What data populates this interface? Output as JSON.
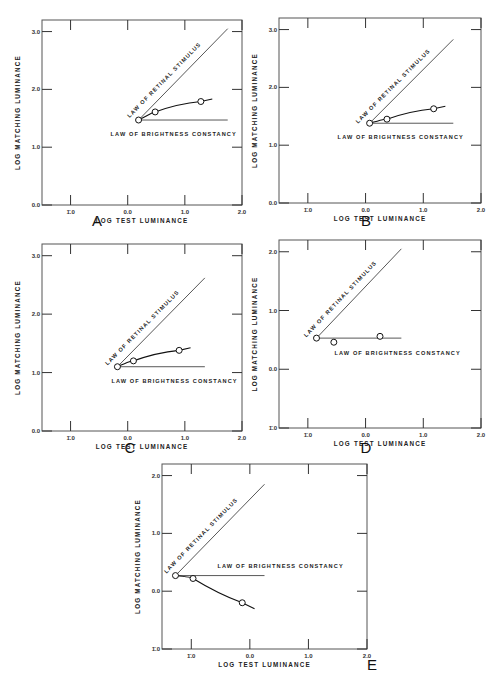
{
  "figure": {
    "panels_order": [
      "A",
      "B",
      "C",
      "D",
      "E"
    ]
  },
  "chart_data": [
    {
      "panel": "A",
      "type": "line",
      "xlabel": "LOG TEST LUMINANCE",
      "ylabel": "LOG MATCHING LUMINANCE",
      "x_ticks": [
        "1̄.0",
        "0.0",
        "1.0",
        "2.0"
      ],
      "x_tick_values": [
        -1.0,
        0.0,
        1.0,
        2.0
      ],
      "y_ticks": [
        "0.0",
        "1.0",
        "2.0",
        "3.0"
      ],
      "y_tick_values": [
        0.0,
        1.0,
        2.0,
        3.0
      ],
      "xlim": [
        -1.5,
        2.0
      ],
      "ylim": [
        0.0,
        3.2
      ],
      "annotations": [
        "LAW OF RETINAL STIMULUS",
        "LAW OF BRIGHTNESS CONSTANCY"
      ],
      "series": [
        {
          "name": "data",
          "x": [
            0.19,
            0.48,
            1.28
          ],
          "y": [
            1.47,
            1.61,
            1.79
          ]
        },
        {
          "name": "LAW OF RETINAL STIMULUS",
          "x": [
            0.19,
            1.75
          ],
          "y": [
            1.47,
            3.05
          ]
        },
        {
          "name": "LAW OF BRIGHTNESS CONSTANCY",
          "x": [
            0.19,
            1.75
          ],
          "y": [
            1.47,
            1.47
          ]
        }
      ]
    },
    {
      "panel": "B",
      "type": "line",
      "xlabel": "LOG TEST LUMINANCE",
      "ylabel": "LOG MATCHING LUMINANCE",
      "x_ticks": [
        "1̄.0",
        "0.0",
        "1.0",
        "2.0"
      ],
      "x_tick_values": [
        -1.0,
        0.0,
        1.0,
        2.0
      ],
      "y_ticks": [
        "0.0",
        "1.0",
        "2.0",
        "3.0"
      ],
      "y_tick_values": [
        0.0,
        1.0,
        2.0,
        3.0
      ],
      "xlim": [
        -1.5,
        2.0
      ],
      "ylim": [
        0.0,
        3.2
      ],
      "annotations": [
        "LAW OF RETINAL STIMULUS",
        "LAW OF BRIGHTNESS CONSTANCY"
      ],
      "series": [
        {
          "name": "data",
          "x": [
            0.07,
            0.37,
            1.18
          ],
          "y": [
            1.38,
            1.45,
            1.63
          ]
        },
        {
          "name": "LAW OF RETINAL STIMULUS",
          "x": [
            0.07,
            1.52
          ],
          "y": [
            1.38,
            2.83
          ]
        },
        {
          "name": "LAW OF BRIGHTNESS CONSTANCY",
          "x": [
            0.07,
            1.52
          ],
          "y": [
            1.38,
            1.38
          ]
        }
      ]
    },
    {
      "panel": "C",
      "type": "line",
      "xlabel": "LOG TEST LUMINANCE",
      "ylabel": "LOG MATCHING LUMINANCE",
      "x_ticks": [
        "1̄.0",
        "0.0",
        "1.0",
        "2.0"
      ],
      "x_tick_values": [
        -1.0,
        0.0,
        1.0,
        2.0
      ],
      "y_ticks": [
        "0.0",
        "1.0",
        "2.0",
        "3.0"
      ],
      "y_tick_values": [
        0.0,
        1.0,
        2.0,
        3.0
      ],
      "xlim": [
        -1.5,
        2.0
      ],
      "ylim": [
        0.0,
        3.2
      ],
      "annotations": [
        "LAW OF RETINAL STIMULUS",
        "LAW OF BRIGHTNESS CONSTANCY"
      ],
      "series": [
        {
          "name": "data",
          "x": [
            -0.18,
            0.1,
            0.9
          ],
          "y": [
            1.1,
            1.2,
            1.38
          ]
        },
        {
          "name": "LAW OF RETINAL STIMULUS",
          "x": [
            -0.18,
            1.35
          ],
          "y": [
            1.1,
            2.62
          ]
        },
        {
          "name": "LAW OF BRIGHTNESS CONSTANCY",
          "x": [
            -0.18,
            1.35
          ],
          "y": [
            1.1,
            1.1
          ]
        }
      ]
    },
    {
      "panel": "D",
      "type": "line",
      "xlabel": "LOG TEST LUMINANCE",
      "ylabel": "LOG MATCHING LUMINANCE",
      "x_ticks": [
        "1̄.0",
        "0.0",
        "1.0",
        "2.0"
      ],
      "x_tick_values": [
        -1.0,
        0.0,
        1.0,
        2.0
      ],
      "y_ticks": [
        "1̄.0",
        "0.0",
        "1.0",
        "2.0"
      ],
      "y_tick_values": [
        -1.0,
        0.0,
        1.0,
        2.0
      ],
      "xlim": [
        -1.5,
        2.0
      ],
      "ylim": [
        -1.0,
        2.2
      ],
      "annotations": [
        "LAW OF RETINAL STIMULUS",
        "LAW OF BRIGHTNESS CONSTANCY"
      ],
      "series": [
        {
          "name": "data",
          "x": [
            -0.85,
            -0.55,
            0.25
          ],
          "y": [
            0.53,
            0.46,
            0.56
          ]
        },
        {
          "name": "LAW OF RETINAL STIMULUS",
          "x": [
            -0.85,
            0.62
          ],
          "y": [
            0.53,
            2.05
          ]
        },
        {
          "name": "LAW OF BRIGHTNESS CONSTANCY",
          "x": [
            -0.85,
            0.62
          ],
          "y": [
            0.53,
            0.53
          ]
        }
      ]
    },
    {
      "panel": "E",
      "type": "line",
      "xlabel": "LOG TEST LUMINANCE",
      "ylabel": "LOG MATCHING LUMINANCE",
      "x_ticks": [
        "1̄.0",
        "0.0",
        "1.0",
        "2.0"
      ],
      "x_tick_values": [
        -1.0,
        0.0,
        1.0,
        2.0
      ],
      "y_ticks": [
        "1̄.0",
        "0.0",
        "1.0",
        "2.0"
      ],
      "y_tick_values": [
        -1.0,
        0.0,
        1.0,
        2.0
      ],
      "xlim": [
        -1.5,
        2.0
      ],
      "ylim": [
        -1.0,
        2.2
      ],
      "annotations": [
        "LAW OF RETINAL STIMULUS",
        "LAW OF BRIGHTNESS CONSTANCY"
      ],
      "series": [
        {
          "name": "data",
          "x": [
            -1.27,
            -0.97,
            -0.13
          ],
          "y": [
            0.27,
            0.22,
            -0.2
          ]
        },
        {
          "name": "LAW OF RETINAL STIMULUS",
          "x": [
            -1.27,
            0.25
          ],
          "y": [
            0.27,
            1.85
          ]
        },
        {
          "name": "LAW OF BRIGHTNESS CONSTANCY",
          "x": [
            -1.27,
            0.25
          ],
          "y": [
            0.27,
            0.27
          ]
        }
      ]
    }
  ],
  "labels": {
    "xlabel": "LOG TEST LUMINANCE",
    "ylabel": "LOG MATCHING LUMINANCE",
    "retinal": "LAW OF RETINAL STIMULUS",
    "constancy": "LAW OF BRIGHTNESS CONSTANCY"
  }
}
